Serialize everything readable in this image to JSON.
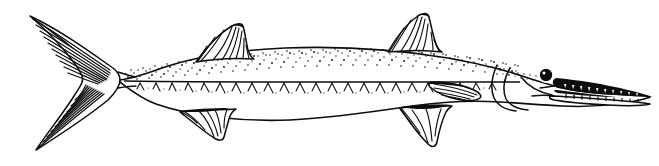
{
  "figure": {
    "kind": "scientific-line-illustration",
    "subject_common_name": "Barracuda",
    "orientation": "lateral view, facing right",
    "technique": "pen-and-ink stipple and hatch line art",
    "caption": "",
    "canvas": {
      "width": 659,
      "height": 166,
      "background_color": "#ffffff",
      "ink_color": "#0d0d0d"
    }
  },
  "anatomy": {
    "parts": [
      {
        "id": "caudal-fin",
        "label": "Caudal fin",
        "note": "deeply forked, heavily hatched with long rays"
      },
      {
        "id": "caudal-peduncle",
        "label": "Caudal peduncle",
        "note": "narrow, stippled above lateral line"
      },
      {
        "id": "first-dorsal-fin",
        "label": "First dorsal fin",
        "note": "spiny triangular fin with hatched rays"
      },
      {
        "id": "second-dorsal-fin",
        "label": "Second dorsal fin",
        "note": "set far back near the tail"
      },
      {
        "id": "anal-fin",
        "label": "Anal fin",
        "note": "mirrors second dorsal on the ventral side"
      },
      {
        "id": "pelvic-fin",
        "label": "Pelvic fin",
        "note": "small, beneath mid-body"
      },
      {
        "id": "pectoral-fin",
        "label": "Pectoral fin",
        "note": "just behind the gill cover"
      },
      {
        "id": "lateral-line",
        "label": "Lateral line",
        "note": "straight line running head to tail"
      },
      {
        "id": "gill-cover",
        "label": "Gill cover (operculum)",
        "note": "curved outline on the head"
      },
      {
        "id": "eye",
        "label": "Eye",
        "note": "solid black round eye high on the head"
      },
      {
        "id": "jaw",
        "label": "Jaw",
        "note": "long pointed jaws lined with sharp teeth"
      },
      {
        "id": "teeth",
        "label": "Teeth",
        "note": "row of sharp triangular teeth in both jaws"
      },
      {
        "id": "snout",
        "label": "Snout",
        "note": "elongated and pointed"
      }
    ]
  },
  "shading": {
    "stipple_region": "upper body above the lateral line",
    "chevron_region": "below the lateral line along the flank",
    "fin_hatching": "parallel ray lines in all fins"
  }
}
